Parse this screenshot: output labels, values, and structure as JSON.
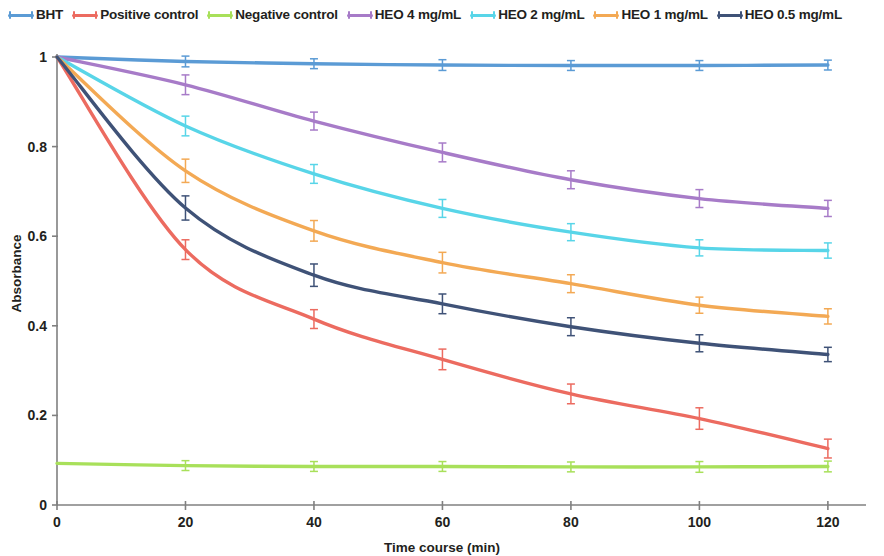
{
  "chart_data": {
    "type": "line",
    "title": "",
    "xlabel": "Time course (min)",
    "ylabel": "Absorbance",
    "x": [
      0,
      20,
      40,
      60,
      80,
      100,
      120
    ],
    "xlim": [
      0,
      125
    ],
    "ylim": [
      0,
      1.04
    ],
    "xticks": [
      "0",
      "20",
      "40",
      "60",
      "80",
      "100",
      "120"
    ],
    "yticks": [
      "0",
      "0.2",
      "0.4",
      "0.6",
      "0.8",
      "1"
    ],
    "grid": false,
    "legend_position": "top",
    "error_bars": true,
    "series": [
      {
        "name": "BHT",
        "color": "#5B9BD5",
        "values": [
          1.0,
          0.99,
          0.985,
          0.982,
          0.981,
          0.981,
          0.982
        ],
        "errors": [
          0.0,
          0.012,
          0.011,
          0.012,
          0.011,
          0.011,
          0.011
        ]
      },
      {
        "name": "Positive control",
        "color": "#EC6B60",
        "values": [
          1.0,
          0.57,
          0.415,
          0.325,
          0.248,
          0.193,
          0.126
        ],
        "errors": [
          0.0,
          0.022,
          0.021,
          0.023,
          0.022,
          0.024,
          0.021
        ]
      },
      {
        "name": "Negative control",
        "color": "#A8E05A",
        "values": [
          0.093,
          0.088,
          0.086,
          0.086,
          0.085,
          0.085,
          0.086
        ],
        "errors": [
          0.0,
          0.011,
          0.011,
          0.011,
          0.011,
          0.012,
          0.012
        ]
      },
      {
        "name": "HEO 4 mg/mL",
        "color": "#A77BC8",
        "values": [
          1.0,
          0.938,
          0.857,
          0.787,
          0.726,
          0.684,
          0.662
        ],
        "errors": [
          0.0,
          0.022,
          0.02,
          0.021,
          0.02,
          0.02,
          0.018
        ]
      },
      {
        "name": "HEO 2 mg/mL",
        "color": "#58D5E8",
        "values": [
          1.0,
          0.846,
          0.739,
          0.662,
          0.609,
          0.574,
          0.568
        ],
        "errors": [
          0.0,
          0.022,
          0.021,
          0.02,
          0.019,
          0.018,
          0.017
        ]
      },
      {
        "name": "HEO 1 mg/mL",
        "color": "#F3A954",
        "values": [
          1.0,
          0.746,
          0.612,
          0.541,
          0.494,
          0.446,
          0.421
        ],
        "errors": [
          0.0,
          0.026,
          0.023,
          0.023,
          0.02,
          0.018,
          0.017
        ]
      },
      {
        "name": "HEO 0.5 mg/mL",
        "color": "#3F5277",
        "values": [
          1.0,
          0.663,
          0.513,
          0.449,
          0.398,
          0.361,
          0.336
        ],
        "errors": [
          0.0,
          0.027,
          0.025,
          0.022,
          0.02,
          0.019,
          0.016
        ]
      }
    ]
  },
  "legend": {
    "items": [
      {
        "label": "BHT"
      },
      {
        "label": "Positive control"
      },
      {
        "label": "Negative control"
      },
      {
        "label": "HEO 4 mg/mL"
      },
      {
        "label": "HEO 2 mg/mL"
      },
      {
        "label": "HEO 1 mg/mL"
      },
      {
        "label": "HEO 0.5 mg/mL"
      }
    ]
  },
  "axes": {
    "y_title": "Absorbance",
    "x_title": "Time course (min)"
  }
}
